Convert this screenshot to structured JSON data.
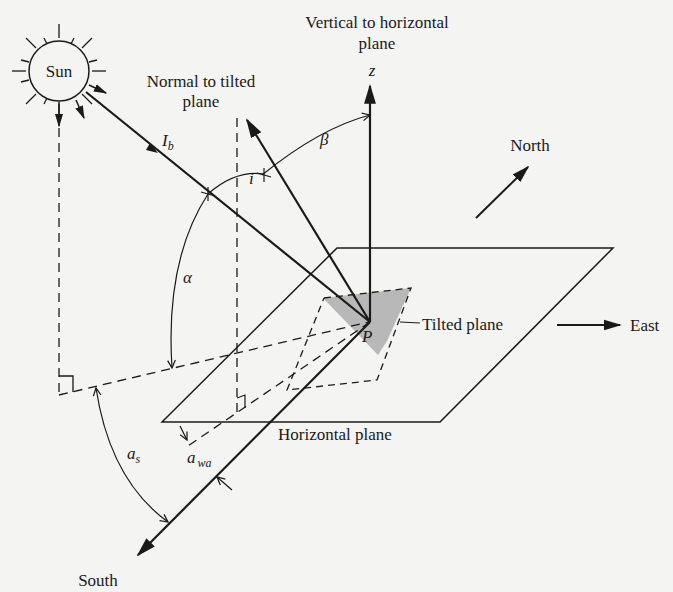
{
  "diagram": {
    "labels": {
      "sun": "Sun",
      "vertical": "Vertical to horizontal",
      "vertical2": "plane",
      "z": "z",
      "normal": "Normal to tilted",
      "normal2": "plane",
      "north": "North",
      "east": "East",
      "south": "South",
      "tilted_plane": "Tilted plane",
      "horizontal_plane": "Horizontal plane",
      "point_p": "P",
      "beam": "I",
      "beam_sub": "b",
      "beta": "β",
      "incidence": "i",
      "alpha": "α",
      "azimuth_sun": "a",
      "azimuth_sun_sub": "s",
      "azimuth_wall": "a",
      "azimuth_wall_sub": "wa"
    },
    "colors": {
      "ink": "#1a1a1a",
      "background": "#f4f4f2",
      "tilted_fill": "#b8b8b8"
    }
  }
}
